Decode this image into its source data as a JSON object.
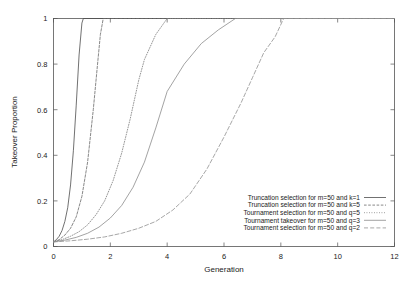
{
  "chart_data": {
    "type": "line",
    "title": "",
    "xlabel": "Generation",
    "ylabel": "Takeover Proportion",
    "xlim": [
      0,
      12
    ],
    "ylim": [
      0,
      1
    ],
    "xticks": [
      "0",
      "2",
      "4",
      "6",
      "8",
      "10",
      "12"
    ],
    "xtick_values": [
      0,
      2,
      4,
      6,
      8,
      10,
      12
    ],
    "yticks": [
      "0",
      "0.2",
      "0.4",
      "0.6",
      "0.8",
      "1"
    ],
    "ytick_values": [
      0,
      0.2,
      0.4,
      0.6,
      0.8,
      1
    ],
    "grid": false,
    "legend_position": "bottom-right",
    "series": [
      {
        "name": "Truncation selection for m=50 and k=1",
        "style": "solid",
        "color": "#4d4d4d",
        "x": [
          0,
          0.1,
          0.2,
          0.3,
          0.4,
          0.5,
          0.6,
          0.7,
          0.8,
          0.9,
          1.0,
          1.05,
          12
        ],
        "y": [
          0.02,
          0.03,
          0.045,
          0.07,
          0.11,
          0.17,
          0.27,
          0.42,
          0.62,
          0.84,
          0.98,
          1.0,
          1.0
        ]
      },
      {
        "name": "Truncation selection for m=50 and k=5",
        "style": "dotted",
        "color": "#6a6a6a",
        "x": [
          0,
          0.2,
          0.4,
          0.6,
          0.8,
          1.0,
          1.2,
          1.4,
          1.55,
          1.65,
          1.75,
          12
        ],
        "y": [
          0.02,
          0.03,
          0.05,
          0.08,
          0.13,
          0.22,
          0.37,
          0.6,
          0.8,
          0.93,
          1.0,
          1.0
        ]
      },
      {
        "name": "Tournament selection for m=50 and q=5",
        "style": "fine-dotted",
        "color": "#7a7a7a",
        "x": [
          0,
          0.3,
          0.6,
          0.9,
          1.2,
          1.5,
          1.8,
          2.1,
          2.4,
          2.7,
          3.0,
          3.2,
          3.6,
          4.0,
          12
        ],
        "y": [
          0.02,
          0.03,
          0.045,
          0.065,
          0.095,
          0.14,
          0.2,
          0.29,
          0.41,
          0.56,
          0.73,
          0.82,
          0.93,
          1.0,
          1.0
        ]
      },
      {
        "name": "Tournament takeover for m=50 and q=3",
        "style": "solid-light",
        "color": "#8c8c8c",
        "x": [
          0,
          0.4,
          0.8,
          1.2,
          1.6,
          2.0,
          2.4,
          2.8,
          3.2,
          3.6,
          4.0,
          4.6,
          5.2,
          5.8,
          6.4,
          12
        ],
        "y": [
          0.02,
          0.028,
          0.04,
          0.058,
          0.085,
          0.125,
          0.18,
          0.26,
          0.37,
          0.52,
          0.68,
          0.8,
          0.89,
          0.95,
          1.0,
          1.0
        ]
      },
      {
        "name": "Tournament selection for m=50 and q=2",
        "style": "dashed",
        "color": "#909090",
        "x": [
          0,
          0.6,
          1.2,
          1.8,
          2.4,
          3.0,
          3.6,
          4.2,
          4.8,
          5.4,
          6.0,
          6.6,
          7.0,
          7.4,
          7.8,
          8.1,
          12
        ],
        "y": [
          0.02,
          0.025,
          0.032,
          0.042,
          0.058,
          0.08,
          0.11,
          0.16,
          0.23,
          0.34,
          0.48,
          0.63,
          0.74,
          0.85,
          0.92,
          1.0,
          1.0
        ]
      }
    ]
  }
}
